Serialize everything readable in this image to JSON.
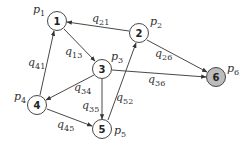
{
  "diagram": {
    "type": "directed-graph",
    "colors": {
      "node_fill": "#ffffff",
      "highlight_fill": "#bdbdbd",
      "stroke": "#333333"
    },
    "nodes": [
      {
        "id": "1",
        "label": "1",
        "prob_base": "p",
        "prob_sub": "1",
        "x": 57,
        "y": 21,
        "highlight": false
      },
      {
        "id": "2",
        "label": "2",
        "prob_base": "p",
        "prob_sub": "2",
        "x": 139,
        "y": 33,
        "highlight": false
      },
      {
        "id": "3",
        "label": "3",
        "prob_base": "p",
        "prob_sub": "3",
        "x": 102,
        "y": 69,
        "highlight": false
      },
      {
        "id": "4",
        "label": "4",
        "prob_base": "p",
        "prob_sub": "4",
        "x": 37,
        "y": 105,
        "highlight": false
      },
      {
        "id": "5",
        "label": "5",
        "prob_base": "p",
        "prob_sub": "5",
        "x": 102,
        "y": 129,
        "highlight": false
      },
      {
        "id": "6",
        "label": "6",
        "prob_base": "p",
        "prob_sub": "6",
        "x": 216,
        "y": 77,
        "highlight": true
      }
    ],
    "edges": [
      {
        "from": "2",
        "to": "1",
        "base": "q",
        "sub": "21"
      },
      {
        "from": "1",
        "to": "3",
        "base": "q",
        "sub": "13"
      },
      {
        "from": "4",
        "to": "1",
        "base": "q",
        "sub": "41"
      },
      {
        "from": "2",
        "to": "6",
        "base": "q",
        "sub": "26"
      },
      {
        "from": "3",
        "to": "6",
        "base": "q",
        "sub": "36"
      },
      {
        "from": "3",
        "to": "4",
        "base": "q",
        "sub": "34"
      },
      {
        "from": "3",
        "to": "5",
        "base": "q",
        "sub": "35"
      },
      {
        "from": "5",
        "to": "2",
        "base": "q",
        "sub": "52"
      },
      {
        "from": "4",
        "to": "5",
        "base": "q",
        "sub": "45"
      }
    ]
  }
}
